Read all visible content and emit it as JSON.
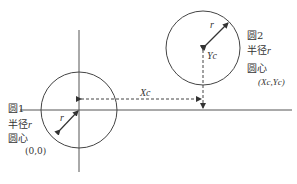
{
  "diagram": {
    "type": "geometry",
    "colors": {
      "stroke": "#444444",
      "text": "#333333",
      "background": "#ffffff"
    },
    "circle1": {
      "title": "圆1",
      "radius_label": "半径",
      "radius_var": "r",
      "center_label": "圆心",
      "center_coords": "(0,0)",
      "arrow_label": "r"
    },
    "circle2": {
      "title": "圆2",
      "radius_label": "半径",
      "radius_var": "r",
      "center_label": "圆心",
      "center_coords": "(Xc,Yc)",
      "arrow_label": "r"
    },
    "offsets": {
      "x_label": "Xc",
      "y_label": "Yc"
    }
  }
}
